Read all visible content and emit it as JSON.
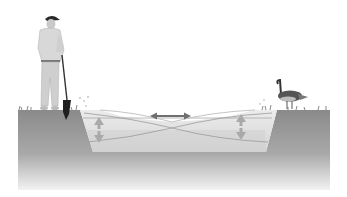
{
  "diagram": {
    "title": "",
    "elements": [
      {
        "id": "ground",
        "label": ""
      },
      {
        "id": "basin",
        "label": ""
      },
      {
        "id": "water-level-high",
        "label": ""
      },
      {
        "id": "water-level-low",
        "label": ""
      },
      {
        "id": "horizontal-arrow",
        "label": ""
      },
      {
        "id": "left-vertical-arrow",
        "label": ""
      },
      {
        "id": "right-vertical-arrow",
        "label": ""
      },
      {
        "id": "person-with-probe",
        "label": ""
      },
      {
        "id": "goose",
        "label": ""
      }
    ]
  },
  "colors": {
    "background": "#ffffff",
    "ground_top": "#8a8a8a",
    "ground_bottom": "#f2f2f2",
    "water_light": "#e6e6e6",
    "water_mid": "#d2d2d2",
    "basin_floor": "#cfcfcf",
    "arrow": "#777777",
    "figure_dark": "#2a2a2a",
    "clothing": "#d8d8d8"
  }
}
